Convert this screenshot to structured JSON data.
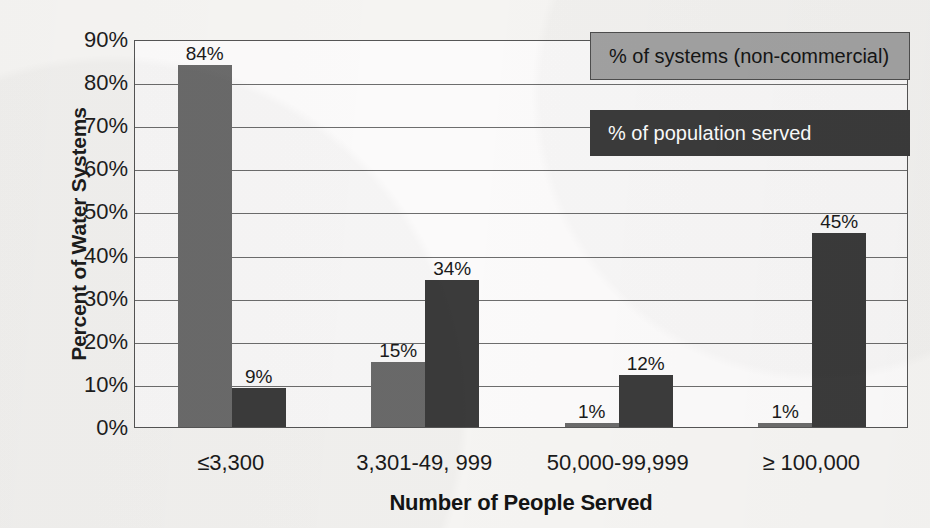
{
  "chart_data": {
    "type": "bar",
    "title": "",
    "xlabel": "Number of People Served",
    "ylabel": "Percent of Water Systems",
    "categories": [
      "≤3,300",
      "3,301-49, 999",
      "50,000-99,999",
      "≥ 100,000"
    ],
    "series": [
      {
        "name": "% of systems (non-commercial)",
        "color": "#6b6b6b",
        "values": [
          84,
          15,
          1,
          1
        ],
        "labels": [
          "84%",
          "15%",
          "1%",
          "1%"
        ]
      },
      {
        "name": "% of population served",
        "color": "#3b3b3b",
        "values": [
          9,
          34,
          12,
          45
        ],
        "labels": [
          "9%",
          "34%",
          "12%",
          "45%"
        ]
      }
    ],
    "ylim": [
      0,
      90
    ],
    "yticks": [
      0,
      10,
      20,
      30,
      40,
      50,
      60,
      70,
      80,
      90
    ],
    "ytick_labels": [
      "0%",
      "10%",
      "20%",
      "30%",
      "40%",
      "50%",
      "60%",
      "70%",
      "80%",
      "90%"
    ],
    "grid": true,
    "legend_position": "top-right"
  },
  "legend": {
    "systems": "% of systems (non-commercial)",
    "population": "% of population served"
  },
  "colors": {
    "series_systems": "#6b6b6b",
    "series_population": "#3b3b3b",
    "background": "#f5f4f2",
    "gridline": "#6d6d6d",
    "axis": "#555555"
  }
}
